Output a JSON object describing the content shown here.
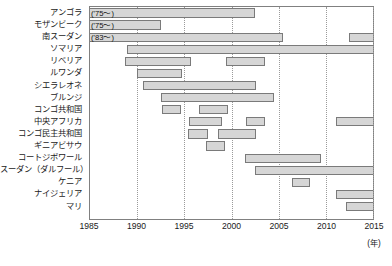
{
  "chart_data": {
    "type": "bar",
    "chart_style": "gantt-timeline",
    "title": "",
    "xlabel": "(年)",
    "ylabel": "",
    "xlim": [
      1985,
      2015
    ],
    "xticks": [
      1985,
      1990,
      1995,
      2000,
      2005,
      2010,
      2015
    ],
    "xtick_labels": [
      "1985",
      "1990",
      "1995",
      "2000",
      "2005",
      "2010",
      "2015"
    ],
    "grid": "vertical-dotted-at-xticks",
    "legend": "none",
    "bar_fill": "#d6d6d6",
    "bar_border": "#7a7a7a",
    "categories": [
      "アンゴラ",
      "モザンビーク",
      "南スーダン",
      "ソマリア",
      "リベリア",
      "ルワンダ",
      "シエラレオネ",
      "ブルンジ",
      "コンゴ共和国",
      "中央アフリカ",
      "コンゴ民主共和国",
      "ギニアビサウ",
      "コートジボワール",
      "スーダン（ダルフール）",
      "ケニア",
      "ナイジェリア",
      "マリ"
    ],
    "rows": [
      {
        "category": "アンゴラ",
        "note": "('75〜)",
        "spans": [
          {
            "start": 1985,
            "end": 2002.5,
            "clipped_left": true
          }
        ]
      },
      {
        "category": "モザンビーク",
        "note": "('75〜)",
        "spans": [
          {
            "start": 1985,
            "end": 1992.5,
            "clipped_left": true
          }
        ]
      },
      {
        "category": "南スーダン",
        "note": "('83〜)",
        "spans": [
          {
            "start": 1985,
            "end": 2005.5,
            "clipped_left": true
          },
          {
            "start": 2012.5,
            "end": 2015,
            "clipped_right": true
          }
        ]
      },
      {
        "category": "ソマリア",
        "note": "",
        "spans": [
          {
            "start": 1988.9,
            "end": 2015,
            "clipped_right": true
          }
        ]
      },
      {
        "category": "リベリア",
        "note": "",
        "spans": [
          {
            "start": 1988.7,
            "end": 1995.7
          },
          {
            "start": 1999.4,
            "end": 2003.5
          }
        ]
      },
      {
        "category": "ルワンダ",
        "note": "",
        "spans": [
          {
            "start": 1990.0,
            "end": 1994.8
          }
        ]
      },
      {
        "category": "シエラレオネ",
        "note": "",
        "spans": [
          {
            "start": 1990.6,
            "end": 2002.6
          }
        ]
      },
      {
        "category": "ブルンジ",
        "note": "",
        "spans": [
          {
            "start": 1992.5,
            "end": 2004.5
          }
        ]
      },
      {
        "category": "コンゴ共和国",
        "note": "",
        "spans": [
          {
            "start": 1992.6,
            "end": 1994.6
          },
          {
            "start": 1996.6,
            "end": 1999.6
          }
        ]
      },
      {
        "category": "中央アフリカ",
        "note": "",
        "spans": [
          {
            "start": 1995.5,
            "end": 1999.0
          },
          {
            "start": 2001.5,
            "end": 2003.6
          },
          {
            "start": 2011.1,
            "end": 2015,
            "clipped_right": true
          }
        ]
      },
      {
        "category": "コンゴ民主共和国",
        "note": "",
        "spans": [
          {
            "start": 1995.4,
            "end": 1997.5
          },
          {
            "start": 1998.6,
            "end": 2002.6
          }
        ]
      },
      {
        "category": "ギニアビサウ",
        "note": "",
        "spans": [
          {
            "start": 1997.3,
            "end": 1999.3
          }
        ]
      },
      {
        "category": "コートジボワール",
        "note": "",
        "spans": [
          {
            "start": 2001.4,
            "end": 2009.5
          }
        ]
      },
      {
        "category": "スーダン（ダルフール）",
        "note": "",
        "spans": [
          {
            "start": 2002.5,
            "end": 2015,
            "clipped_right": true
          }
        ]
      },
      {
        "category": "ケニア",
        "note": "",
        "spans": [
          {
            "start": 2006.4,
            "end": 2008.3
          }
        ]
      },
      {
        "category": "ナイジェリア",
        "note": "",
        "spans": [
          {
            "start": 2011.1,
            "end": 2015,
            "clipped_right": true
          }
        ]
      },
      {
        "category": "マリ",
        "note": "",
        "spans": [
          {
            "start": 2012.1,
            "end": 2015,
            "clipped_right": true
          }
        ]
      }
    ]
  }
}
